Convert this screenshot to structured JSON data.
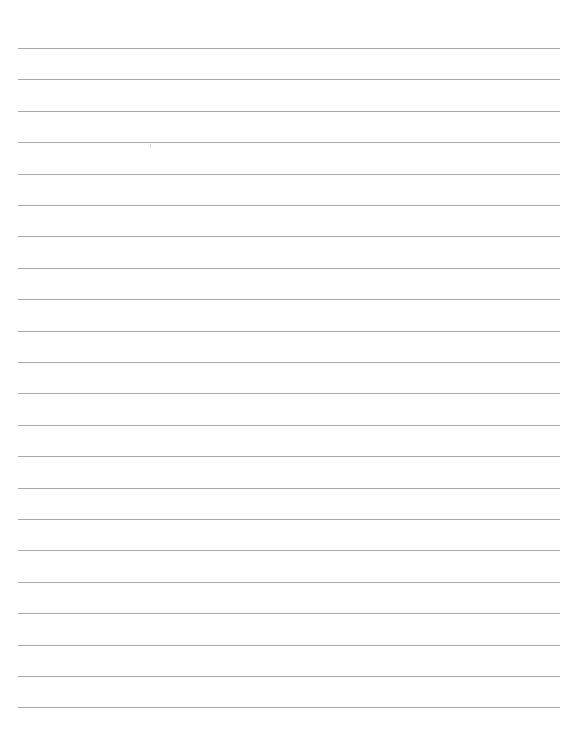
{
  "document": {
    "type": "lined-paper",
    "line_count": 22,
    "first_line_y": 48,
    "line_spacing": 31.4,
    "line_left": 18,
    "line_right": 560,
    "line_color": "#9a9a9a",
    "background_color": "#ffffff",
    "lines": [
      {
        "text": ""
      },
      {
        "text": ""
      },
      {
        "text": ""
      },
      {
        "text": ""
      },
      {
        "text": ""
      },
      {
        "text": ""
      },
      {
        "text": ""
      },
      {
        "text": ""
      },
      {
        "text": ""
      },
      {
        "text": ""
      },
      {
        "text": ""
      },
      {
        "text": ""
      },
      {
        "text": ""
      },
      {
        "text": ""
      },
      {
        "text": ""
      },
      {
        "text": ""
      },
      {
        "text": ""
      },
      {
        "text": ""
      },
      {
        "text": ""
      },
      {
        "text": ""
      },
      {
        "text": ""
      },
      {
        "text": ""
      }
    ]
  }
}
